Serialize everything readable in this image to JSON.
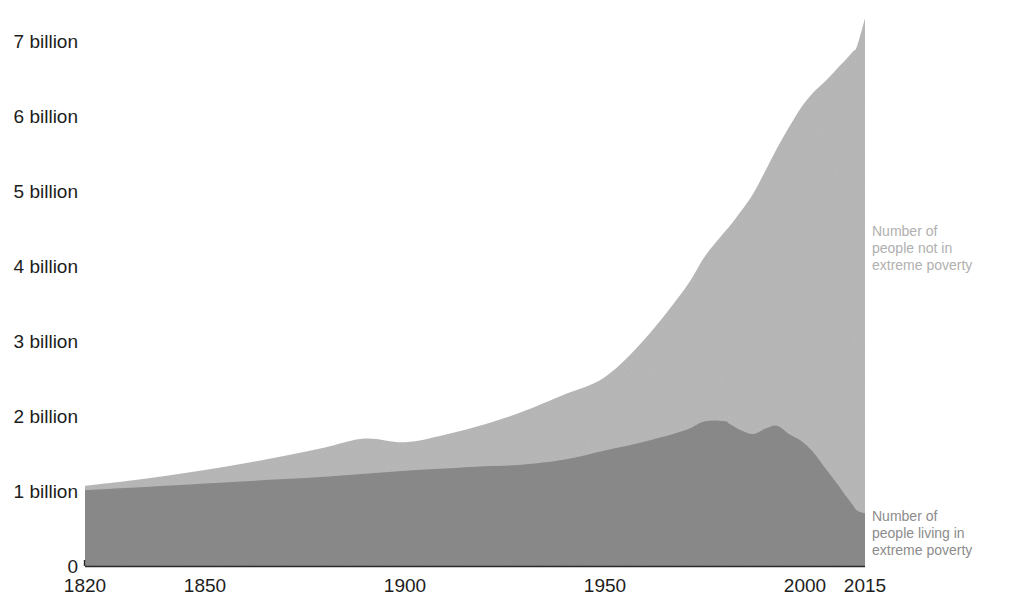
{
  "chart_data": {
    "type": "area",
    "title": "",
    "subtitle": "",
    "xlabel": "",
    "ylabel": "",
    "stacked": true,
    "grid": false,
    "legend_position": "right-inline",
    "xlim": [
      1820,
      2015
    ],
    "ylim": [
      0,
      7400000000
    ],
    "ytick_values": [
      0,
      1000000000,
      2000000000,
      3000000000,
      4000000000,
      5000000000,
      6000000000,
      7000000000
    ],
    "ytick_labels": [
      "0",
      "1 billion",
      "2 billion",
      "3 billion",
      "4 billion",
      "5 billion",
      "6 billion",
      "7 billion"
    ],
    "xtick_values": [
      1820,
      1850,
      1900,
      1950,
      2000,
      2015
    ],
    "xtick_labels": [
      "1820",
      "1850",
      "1900",
      "1950",
      "2000",
      "2015"
    ],
    "colors": {
      "not_in_poverty": "#b8b8b8",
      "in_poverty": "#8a8a8a",
      "axis": "#2a2a2a",
      "tick_text": "#1d1d1d",
      "legend_upper_text": "#b0b0b0",
      "legend_lower_text": "#8c8c8c"
    },
    "x": [
      1820,
      1830,
      1840,
      1850,
      1860,
      1870,
      1880,
      1890,
      1900,
      1910,
      1920,
      1929,
      1940,
      1950,
      1960,
      1970,
      1975,
      1980,
      1981,
      1984,
      1987,
      1990,
      1993,
      1996,
      1999,
      2002,
      2005,
      2008,
      2010,
      2011,
      2012,
      2013,
      2015
    ],
    "series": [
      {
        "name": "Number of people living in extreme poverty",
        "legend_label": "Number of\npeople living in\nextreme poverty",
        "color": "#8a8a8a",
        "values": [
          1010000000,
          1040000000,
          1070000000,
          1100000000,
          1130000000,
          1160000000,
          1190000000,
          1230000000,
          1270000000,
          1300000000,
          1330000000,
          1350000000,
          1420000000,
          1540000000,
          1660000000,
          1810000000,
          1930000000,
          1930000000,
          1900000000,
          1810000000,
          1760000000,
          1830000000,
          1870000000,
          1760000000,
          1670000000,
          1520000000,
          1310000000,
          1100000000,
          950000000,
          880000000,
          810000000,
          740000000,
          700000000
        ]
      },
      {
        "name": "Number of people not in extreme poverty",
        "legend_label": "Number of\npeople not in\nextreme poverty",
        "color": "#b8b8b8",
        "values": [
          60000000,
          90000000,
          130000000,
          180000000,
          240000000,
          310000000,
          390000000,
          470000000,
          380000000,
          450000000,
          560000000,
          700000000,
          870000000,
          980000000,
          1370000000,
          1890000000,
          2200000000,
          2530000000,
          2620000000,
          2920000000,
          3200000000,
          3430000000,
          3700000000,
          4090000000,
          4440000000,
          4790000000,
          5150000000,
          5530000000,
          5790000000,
          5920000000,
          6050000000,
          6190000000,
          6600000000
        ]
      }
    ],
    "totals_note": "Stacked total equals world population"
  },
  "axis": {
    "y_labels": [
      "7 billion",
      "6 billion",
      "5 billion",
      "4 billion",
      "3 billion",
      "2 billion",
      "1 billion",
      "0"
    ],
    "x_labels": [
      "1820",
      "1850",
      "1900",
      "1950",
      "2000",
      "2015"
    ]
  },
  "legend": {
    "upper": {
      "line1": "Number of",
      "line2": "people not in",
      "line3": "extreme poverty"
    },
    "lower": {
      "line1": "Number of",
      "line2": "people living in",
      "line3": "extreme poverty"
    }
  }
}
